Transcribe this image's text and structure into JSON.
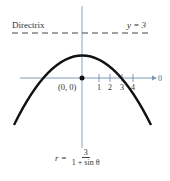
{
  "diagram": {
    "directrix_label": "Directrix",
    "directrix_equation": "y = 3",
    "origin_label": "(0, 0)",
    "polar_axis_label": "0",
    "tick_labels": [
      "1",
      "2",
      "3",
      "4"
    ],
    "formula": {
      "lhs": "r =",
      "numerator": "3",
      "denominator": "1 + sin θ"
    }
  },
  "colors": {
    "curve": "#111111",
    "axis": "#7a9ab8",
    "directrix": "#444444"
  }
}
